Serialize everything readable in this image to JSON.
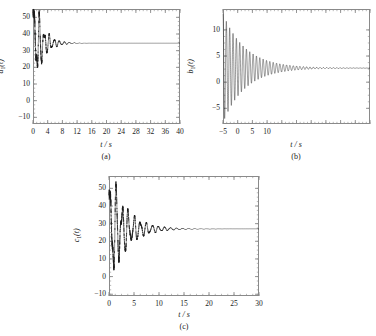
{
  "figure": {
    "background": "#ffffff",
    "axis_color": "#8a8a8a",
    "curve_color": "#1a1a1a"
  },
  "chart_data": [
    {
      "id": "a",
      "type": "line",
      "title": "",
      "panel_label": "(a)",
      "xlabel": "t / s",
      "ylabel": "a₁(t)",
      "ylabel_base": "a",
      "ylabel_sub": "1",
      "ylabel_suffix": "(t)",
      "xlim": [
        0,
        40
      ],
      "ylim": [
        -14,
        55
      ],
      "xticks": [
        0,
        4,
        8,
        12,
        16,
        20,
        24,
        28,
        32,
        36,
        40
      ],
      "yticks": [
        -10,
        0,
        10,
        20,
        30,
        40,
        50
      ],
      "xtick_labels": [
        "0",
        "4",
        "8",
        "12",
        "16",
        "20",
        "24",
        "28",
        "32",
        "36",
        "40"
      ],
      "ytick_labels": [
        "−10",
        "0",
        "10",
        "20",
        "30",
        "40",
        "50"
      ],
      "minor_ticks": true,
      "grid": false,
      "legend": "none",
      "steady_state": 34.5,
      "initial_value": -13,
      "peak_value": 53,
      "peak_time": 3.0,
      "settle_time": 13,
      "damping": 0.42,
      "frequencies": [
        4.6,
        7.3,
        11.1
      ],
      "amplitudes": [
        26,
        12,
        7
      ],
      "phases": [
        0.0,
        1.1,
        2.3
      ],
      "description": "Irregular multi-frequency damped transient rising from -13 to steady state 34.5"
    },
    {
      "id": "b",
      "type": "line",
      "title": "",
      "panel_label": "(b)",
      "xlabel": "t / s",
      "ylabel": "b₁(t)",
      "ylabel_base": "b",
      "ylabel_sub": "1",
      "ylabel_suffix": "(t)",
      "xlim": [
        0,
        40
      ],
      "ylim": [
        -8,
        14
      ],
      "xticks": [
        0,
        4,
        8,
        12,
        16,
        20,
        24,
        28,
        32,
        36,
        40
      ],
      "yticks": [
        -5,
        0,
        5,
        10
      ],
      "xtick_labels": [
        "−5",
        "0",
        "5",
        "10"
      ],
      "ytick_labels": [
        "−5",
        "0",
        "5",
        "10"
      ],
      "minor_ticks": true,
      "grid": false,
      "legend": "none",
      "steady_state": 2.7,
      "initial_value": 13,
      "peak_value": 13.2,
      "trough_value": -7.2,
      "settle_time": 26,
      "damping": 0.165,
      "frequencies": [
        6.9
      ],
      "amplitudes": [
        10.4
      ],
      "phases": [
        1.5707963
      ],
      "description": "Clean dense sinusoid within smooth exponential decay envelope converging to 2.7"
    },
    {
      "id": "c",
      "type": "line",
      "title": "",
      "panel_label": "(c)",
      "xlabel": "t / s",
      "ylabel": "c₁(t)",
      "ylabel_base": "c",
      "ylabel_sub": "1",
      "ylabel_suffix": "(t)",
      "xlim": [
        0,
        30
      ],
      "ylim": [
        -11,
        57
      ],
      "xticks": [
        0,
        5,
        10,
        15,
        20,
        25,
        30
      ],
      "yticks": [
        -10,
        0,
        10,
        20,
        30,
        40,
        50
      ],
      "xtick_labels": [
        "0",
        "5",
        "10",
        "15",
        "20",
        "25",
        "30"
      ],
      "ytick_labels": [
        "−10",
        "0",
        "10",
        "20",
        "30",
        "40",
        "50"
      ],
      "minor_ticks": true,
      "grid": false,
      "legend": "none",
      "steady_state": 27,
      "initial_value": 22,
      "peak_value": 55,
      "trough_value": -9,
      "settle_time": 14,
      "damping": 0.3,
      "frequencies": [
        5.2,
        8.4,
        13.0
      ],
      "amplitudes": [
        28,
        11,
        6
      ],
      "phases": [
        0.4,
        2.0,
        3.4
      ],
      "description": "Multi-frequency damped oscillation peaking near 55 and settling at 27"
    }
  ]
}
